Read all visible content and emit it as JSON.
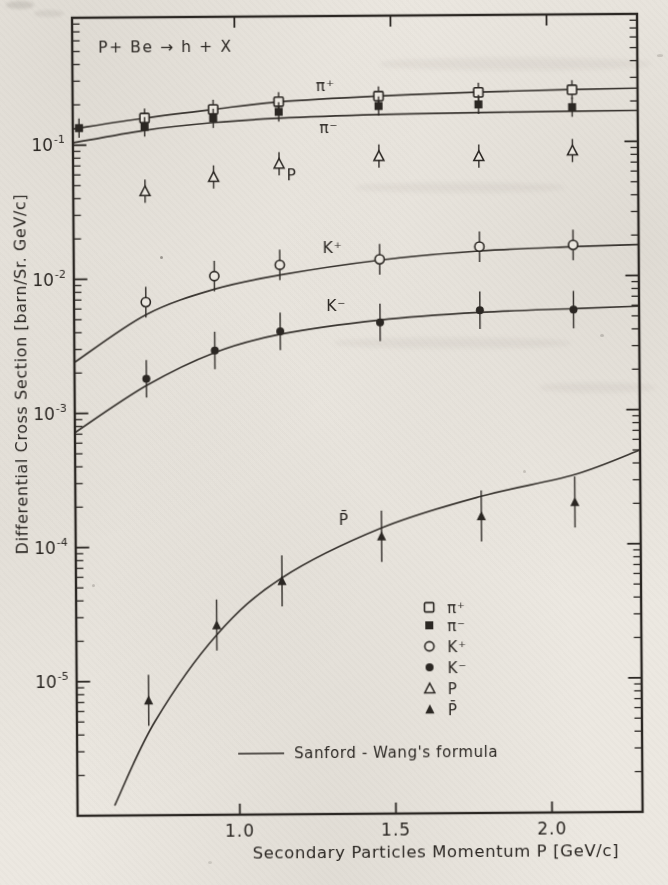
{
  "page": {
    "paper_color": "#ece8e1",
    "ink_color": "#2b2723"
  },
  "chart_data": {
    "type": "scatter",
    "title": "P+ Be → h + X",
    "xlabel": "Secondary Particles Momentum P  [GeV/c]",
    "ylabel": "Differential Cross Section  [barn/Sr. GeV/c]",
    "xlim": [
      0.48,
      2.29
    ],
    "ylim_log10": [
      -6.0,
      -0.05
    ],
    "grid": false,
    "x_ticks": [
      {
        "value": 1.0,
        "label": "1.0"
      },
      {
        "value": 1.5,
        "label": "1.5"
      },
      {
        "value": 2.0,
        "label": "2.0"
      }
    ],
    "y_ticks": [
      {
        "exp": -1,
        "base": "10",
        "sup": "-1"
      },
      {
        "exp": -2,
        "base": "10",
        "sup": "-2"
      },
      {
        "exp": -3,
        "base": "10",
        "sup": "-3"
      },
      {
        "exp": -4,
        "base": "10",
        "sup": "-4"
      },
      {
        "exp": -5,
        "base": "10",
        "sup": "-5"
      }
    ],
    "legend_position": "lower-right",
    "legend": {
      "entries": [
        {
          "marker": "square-open",
          "label": "π⁺"
        },
        {
          "marker": "square-filled",
          "label": "π⁻"
        },
        {
          "marker": "circle-open",
          "label": "K⁺"
        },
        {
          "marker": "circle-filled",
          "label": "K⁻"
        },
        {
          "marker": "triangle-open",
          "label": "P"
        },
        {
          "marker": "triangle-filled",
          "label": "P̄"
        }
      ],
      "line_entry_label": "Sanford - Wang's  formula"
    },
    "series": [
      {
        "name": "pi-plus",
        "label": "π⁺",
        "marker": "square-open",
        "label_pos": [
          1.29,
          0.27
        ],
        "err_factor": 1.18,
        "p": [
          0.71,
          0.93,
          1.14,
          1.46,
          1.78,
          2.08
        ],
        "v": [
          0.158,
          0.182,
          0.206,
          0.224,
          0.236,
          0.244
        ],
        "curve": [
          [
            0.48,
            0.132
          ],
          [
            0.71,
            0.158
          ],
          [
            0.93,
            0.182
          ],
          [
            1.14,
            0.205
          ],
          [
            1.46,
            0.224
          ],
          [
            1.78,
            0.237
          ],
          [
            2.08,
            0.245
          ],
          [
            2.29,
            0.249
          ]
        ]
      },
      {
        "name": "pi-minus",
        "label": "π⁻",
        "marker": "square-filled",
        "label_pos": [
          1.3,
          0.131
        ],
        "err_factor": 1.18,
        "p": [
          0.5,
          0.71,
          0.93,
          1.14,
          1.46,
          1.78,
          2.08
        ],
        "v": [
          0.134,
          0.136,
          0.156,
          0.173,
          0.189,
          0.192,
          0.181
        ],
        "curve": [
          [
            0.48,
            0.104
          ],
          [
            0.71,
            0.128
          ],
          [
            0.93,
            0.145
          ],
          [
            1.14,
            0.155
          ],
          [
            1.46,
            0.163
          ],
          [
            1.78,
            0.167
          ],
          [
            2.08,
            0.169
          ],
          [
            2.29,
            0.17
          ]
        ]
      },
      {
        "name": "k-plus",
        "label": "K⁺",
        "marker": "circle-open",
        "label_pos": [
          1.31,
          0.0166
        ],
        "err_factor": 1.3,
        "p": [
          0.71,
          0.93,
          1.14,
          1.46,
          1.78,
          2.08
        ],
        "v": [
          0.0067,
          0.0104,
          0.0125,
          0.0136,
          0.0167,
          0.017
        ],
        "curve": [
          [
            0.48,
            0.0024
          ],
          [
            0.71,
            0.0054
          ],
          [
            0.93,
            0.0083
          ],
          [
            1.14,
            0.0105
          ],
          [
            1.46,
            0.0134
          ],
          [
            1.78,
            0.0155
          ],
          [
            2.08,
            0.0165
          ],
          [
            2.29,
            0.017
          ]
        ]
      },
      {
        "name": "k-minus",
        "label": "K⁻",
        "marker": "circle-filled",
        "label_pos": [
          1.32,
          0.0061
        ],
        "err_factor": 1.38,
        "p": [
          0.71,
          0.93,
          1.14,
          1.46,
          1.78,
          2.08
        ],
        "v": [
          0.0018,
          0.0029,
          0.004,
          0.0046,
          0.0056,
          0.0056
        ],
        "curve": [
          [
            0.48,
            0.00072
          ],
          [
            0.71,
            0.0016
          ],
          [
            0.93,
            0.0028
          ],
          [
            1.14,
            0.0038
          ],
          [
            1.46,
            0.0048
          ],
          [
            1.78,
            0.0054
          ],
          [
            2.08,
            0.0057
          ],
          [
            2.29,
            0.0059
          ]
        ]
      },
      {
        "name": "proton",
        "label": "P",
        "marker": "triangle-open",
        "label_pos": [
          1.18,
          0.058
        ],
        "err_factor": 1.22,
        "p": [
          0.71,
          0.93,
          1.14,
          1.46,
          1.78,
          2.08
        ],
        "v": [
          0.045,
          0.057,
          0.071,
          0.08,
          0.079,
          0.086
        ],
        "curve": null
      },
      {
        "name": "antiproton",
        "label": "P̄",
        "marker": "triangle-filled",
        "label_pos": [
          1.34,
          0.000155
        ],
        "err_factor": 1.55,
        "p": [
          0.71,
          0.93,
          1.14,
          1.46,
          1.78,
          2.08
        ],
        "v": [
          7.2e-06,
          2.6e-05,
          5.5e-05,
          0.000117,
          0.000164,
          0.000206
        ],
        "curve": [
          [
            0.6,
            1.2e-06
          ],
          [
            0.73,
            5e-06
          ],
          [
            0.93,
            2.2e-05
          ],
          [
            1.14,
            5.8e-05
          ],
          [
            1.46,
            0.000135
          ],
          [
            1.78,
            0.00023
          ],
          [
            2.08,
            0.00033
          ],
          [
            2.29,
            0.0005
          ]
        ]
      }
    ]
  }
}
